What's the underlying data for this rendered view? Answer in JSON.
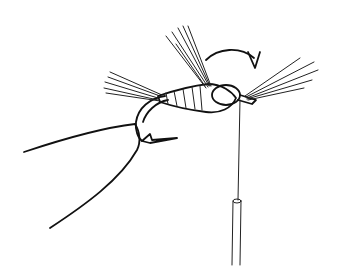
{
  "illustration": {
    "subject": "fly-tying step: hackle fibers wrapped at head of hook held in vise, thread and bobbin hanging below",
    "ink_color": "#111111",
    "background_color": "#ffffff"
  }
}
